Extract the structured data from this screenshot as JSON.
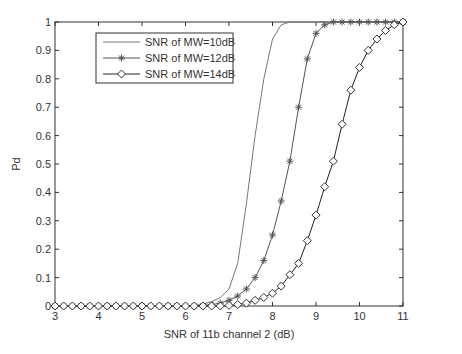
{
  "chart_data": {
    "type": "line",
    "title": "",
    "xlabel": "SNR of 11b channel 2 (dB)",
    "ylabel": "Pd",
    "xlim": [
      3,
      11
    ],
    "ylim": [
      0,
      1
    ],
    "xticks": [
      3,
      4,
      5,
      6,
      7,
      8,
      9,
      10,
      11
    ],
    "yticks": [
      0,
      0.1,
      0.2,
      0.3,
      0.4,
      0.5,
      0.6,
      0.7,
      0.8,
      0.9,
      1
    ],
    "grid": false,
    "legend_position": "upper left",
    "x": [
      3.0,
      3.2,
      3.4,
      3.6,
      3.8,
      4.0,
      4.2,
      4.4,
      4.6,
      4.8,
      5.0,
      5.2,
      5.4,
      5.6,
      5.8,
      6.0,
      6.2,
      6.4,
      6.6,
      6.8,
      7.0,
      7.2,
      7.4,
      7.6,
      7.8,
      8.0,
      8.2,
      8.4,
      8.6,
      8.8,
      9.0,
      9.2,
      9.4,
      9.6,
      9.8,
      10.0,
      10.2,
      10.4,
      10.6,
      10.8,
      11.0
    ],
    "series": [
      {
        "name": "SNR of MW=10dB",
        "marker": "none",
        "values": [
          0,
          0,
          0,
          0,
          0,
          0,
          0,
          0,
          0,
          0,
          0,
          0,
          0,
          0,
          0,
          0,
          0.002,
          0.006,
          0.015,
          0.03,
          0.06,
          0.15,
          0.36,
          0.6,
          0.8,
          0.94,
          0.99,
          1,
          1,
          1,
          1,
          1,
          1,
          1,
          1,
          1,
          1,
          1,
          1,
          1,
          1
        ]
      },
      {
        "name": "SNR of MW=12dB",
        "marker": "star",
        "values": [
          0,
          0,
          0,
          0,
          0,
          0,
          0,
          0,
          0,
          0,
          0,
          0,
          0,
          0,
          0,
          0,
          0,
          0.002,
          0.005,
          0.01,
          0.02,
          0.035,
          0.06,
          0.1,
          0.16,
          0.25,
          0.37,
          0.51,
          0.7,
          0.87,
          0.96,
          0.99,
          1,
          1,
          1,
          1,
          1,
          1,
          1,
          1,
          1
        ]
      },
      {
        "name": "SNR of MW=14dB",
        "marker": "diamond",
        "values": [
          0,
          0,
          0,
          0,
          0,
          0,
          0,
          0,
          0,
          0,
          0,
          0,
          0,
          0,
          0,
          0,
          0,
          0,
          0,
          0,
          0.002,
          0.005,
          0.01,
          0.02,
          0.03,
          0.045,
          0.07,
          0.11,
          0.15,
          0.23,
          0.32,
          0.42,
          0.51,
          0.64,
          0.76,
          0.84,
          0.9,
          0.94,
          0.97,
          0.99,
          1.0
        ]
      }
    ]
  }
}
